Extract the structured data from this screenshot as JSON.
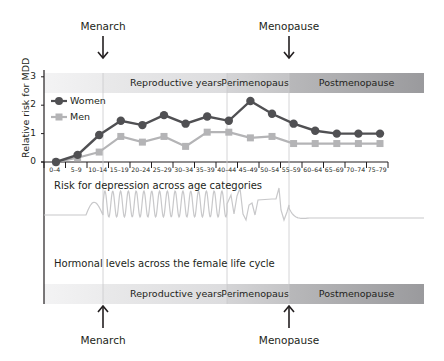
{
  "events": {
    "top": [
      {
        "label": "Menarch",
        "x": 103
      },
      {
        "label": "Menopause",
        "x": 289
      }
    ],
    "bottom": [
      {
        "label": "Menarch",
        "x": 103
      },
      {
        "label": "Menopause",
        "x": 289
      }
    ]
  },
  "phases": [
    {
      "label": "",
      "from": 44,
      "to": 103
    },
    {
      "label": "Reproductive years",
      "from": 103,
      "to": 227
    },
    {
      "label": "Perimenopause",
      "from": 227,
      "to": 289
    },
    {
      "label": "Postmenopause",
      "from": 289,
      "to": 424
    }
  ],
  "captions": {
    "risk": "Risk for depression across age categories",
    "hormonal": "Hormonal levels across the female life cycle"
  },
  "legend": {
    "women": "Women",
    "men": "Men"
  },
  "colors": {
    "women": "#505053",
    "men": "#b4b4b6",
    "hormone": "#c8c8ca",
    "axis": "#231f20"
  },
  "chart_data": {
    "type": "line",
    "title": "Risk for depression across age categories",
    "xlabel": "",
    "ylabel": "Relative risk for MDD",
    "ylim": [
      0,
      3
    ],
    "yticks": [
      0,
      1,
      2,
      3
    ],
    "grid": false,
    "legend_position": "upper-left",
    "categories": [
      "0–4",
      "5–9",
      "10–14",
      "15–19",
      "20–24",
      "25–29",
      "30–34",
      "35–39",
      "40–44",
      "45–49",
      "50–54",
      "55–59",
      "60–64",
      "65–69",
      "70–74",
      "75–79"
    ],
    "series": [
      {
        "name": "Women",
        "marker": "circle",
        "values": [
          0.0,
          0.25,
          0.95,
          1.45,
          1.3,
          1.65,
          1.35,
          1.6,
          1.45,
          2.15,
          1.7,
          1.35,
          1.1,
          1.0,
          1.0,
          1.0
        ]
      },
      {
        "name": "Men",
        "marker": "square",
        "values": [
          0.0,
          0.15,
          0.35,
          0.9,
          0.7,
          0.9,
          0.55,
          1.05,
          1.05,
          0.85,
          0.9,
          0.65,
          0.65,
          0.65,
          0.65,
          0.65
        ]
      }
    ],
    "annotations": [
      "Menarch",
      "Menopause",
      "Reproductive years",
      "Perimenopause",
      "Postmenopause",
      "Hormonal levels across the female life cycle"
    ]
  }
}
